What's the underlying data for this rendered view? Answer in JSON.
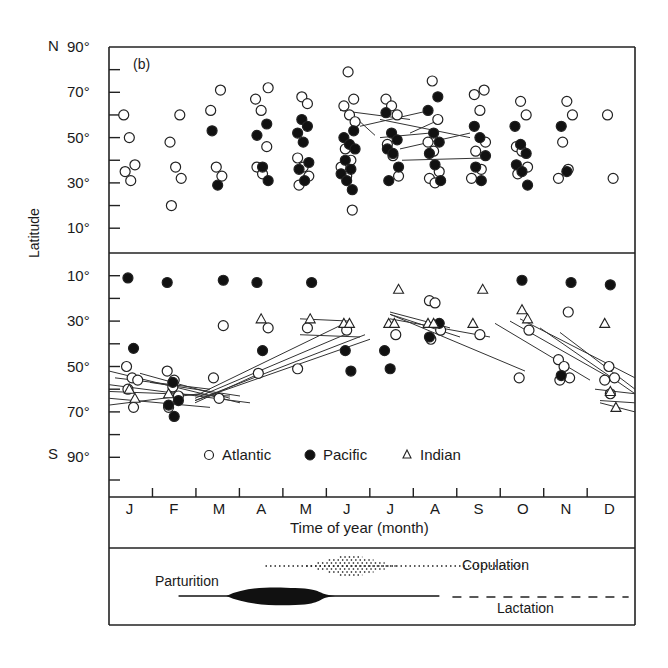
{
  "chart_data": {
    "type": "scatter",
    "panel_label": "(b)",
    "title": "",
    "xlabel": "Time of year (month)",
    "ylabel": "Latitude",
    "categories": [
      "J",
      "F",
      "M",
      "A",
      "M",
      "J",
      "J",
      "A",
      "S",
      "O",
      "N",
      "D"
    ],
    "y_ticks_north": [
      "90°",
      "70°",
      "50°",
      "30°",
      "10°"
    ],
    "y_ticks_south": [
      "10°",
      "30°",
      "50°",
      "70°",
      "90°"
    ],
    "hemisphere_labels": {
      "north": "N",
      "south": "S"
    },
    "legend": [
      {
        "name": "Atlantic",
        "marker": "open-circle"
      },
      {
        "name": "Pacific",
        "marker": "filled-circle"
      },
      {
        "name": "Indian",
        "marker": "open-triangle"
      }
    ],
    "legend_position": "bottom-inside-south-panel",
    "grid": false,
    "series": [
      {
        "name": "Atlantic",
        "hemisphere": "N",
        "points": [
          [
            1,
            60
          ],
          [
            1,
            50
          ],
          [
            1,
            38
          ],
          [
            1,
            35
          ],
          [
            1,
            31
          ],
          [
            2,
            60
          ],
          [
            2,
            48
          ],
          [
            2,
            37
          ],
          [
            2,
            32
          ],
          [
            2,
            20
          ],
          [
            3,
            71
          ],
          [
            3,
            62
          ],
          [
            3,
            37
          ],
          [
            3,
            33
          ],
          [
            4,
            67
          ],
          [
            4,
            62
          ],
          [
            4,
            46
          ],
          [
            4,
            37
          ],
          [
            4,
            34
          ],
          [
            4,
            72
          ],
          [
            5,
            68
          ],
          [
            5,
            65
          ],
          [
            5,
            41
          ],
          [
            5,
            37
          ],
          [
            5,
            33
          ],
          [
            5,
            29
          ],
          [
            6,
            79
          ],
          [
            6,
            67
          ],
          [
            6,
            64
          ],
          [
            6,
            60
          ],
          [
            6,
            57
          ],
          [
            6,
            45
          ],
          [
            6,
            40
          ],
          [
            6,
            37
          ],
          [
            6,
            33
          ],
          [
            6,
            18
          ],
          [
            7,
            67
          ],
          [
            7,
            64
          ],
          [
            7,
            60
          ],
          [
            7,
            47
          ],
          [
            7,
            42
          ],
          [
            7,
            33
          ],
          [
            8,
            75
          ],
          [
            8,
            58
          ],
          [
            8,
            48
          ],
          [
            8,
            44
          ],
          [
            8,
            35
          ],
          [
            8,
            32
          ],
          [
            8,
            30
          ],
          [
            9,
            71
          ],
          [
            9,
            69
          ],
          [
            9,
            62
          ],
          [
            9,
            48
          ],
          [
            9,
            44
          ],
          [
            9,
            36
          ],
          [
            9,
            32
          ],
          [
            10,
            66
          ],
          [
            10,
            60
          ],
          [
            10,
            46
          ],
          [
            10,
            44
          ],
          [
            10,
            37
          ],
          [
            10,
            34
          ],
          [
            11,
            66
          ],
          [
            11,
            60
          ],
          [
            11,
            48
          ],
          [
            11,
            36
          ],
          [
            11,
            32
          ],
          [
            12,
            60
          ],
          [
            12,
            32
          ]
        ]
      },
      {
        "name": "Pacific",
        "hemisphere": "N",
        "points": [
          [
            3,
            53
          ],
          [
            3,
            29
          ],
          [
            4,
            56
          ],
          [
            4,
            51
          ],
          [
            4,
            37
          ],
          [
            4,
            31
          ],
          [
            5,
            58
          ],
          [
            5,
            55
          ],
          [
            5,
            52
          ],
          [
            5,
            48
          ],
          [
            5,
            39
          ],
          [
            5,
            36
          ],
          [
            5,
            31
          ],
          [
            6,
            53
          ],
          [
            6,
            50
          ],
          [
            6,
            47
          ],
          [
            6,
            45
          ],
          [
            6,
            40
          ],
          [
            6,
            36
          ],
          [
            6,
            34
          ],
          [
            6,
            31
          ],
          [
            6,
            27
          ],
          [
            7,
            61
          ],
          [
            7,
            52
          ],
          [
            7,
            49
          ],
          [
            7,
            45
          ],
          [
            7,
            43
          ],
          [
            7,
            37
          ],
          [
            7,
            31
          ],
          [
            8,
            68
          ],
          [
            8,
            62
          ],
          [
            8,
            52
          ],
          [
            8,
            48
          ],
          [
            8,
            43
          ],
          [
            8,
            38
          ],
          [
            8,
            31
          ],
          [
            9,
            55
          ],
          [
            9,
            50
          ],
          [
            9,
            42
          ],
          [
            9,
            37
          ],
          [
            9,
            31
          ],
          [
            10,
            55
          ],
          [
            10,
            47
          ],
          [
            10,
            43
          ],
          [
            10,
            38
          ],
          [
            10,
            35
          ],
          [
            10,
            29
          ],
          [
            11,
            55
          ],
          [
            11,
            35
          ]
        ]
      },
      {
        "name": "Atlantic",
        "hemisphere": "S",
        "points": [
          [
            1,
            50
          ],
          [
            1,
            55
          ],
          [
            1,
            56
          ],
          [
            1,
            60
          ],
          [
            1,
            68
          ],
          [
            2,
            52
          ],
          [
            2,
            59
          ],
          [
            2,
            63
          ],
          [
            2,
            68
          ],
          [
            2,
            56
          ],
          [
            3,
            32
          ],
          [
            3,
            55
          ],
          [
            3,
            64
          ],
          [
            4,
            33
          ],
          [
            4,
            53
          ],
          [
            5,
            33
          ],
          [
            5,
            51
          ],
          [
            6,
            34
          ],
          [
            7,
            36
          ],
          [
            8,
            21
          ],
          [
            8,
            22
          ],
          [
            8,
            34
          ],
          [
            8,
            38
          ],
          [
            9,
            36
          ],
          [
            10,
            34
          ],
          [
            10,
            55
          ],
          [
            11,
            26
          ],
          [
            11,
            47
          ],
          [
            11,
            50
          ],
          [
            11,
            55
          ],
          [
            11,
            56
          ],
          [
            12,
            50
          ],
          [
            12,
            55
          ],
          [
            12,
            56
          ],
          [
            12,
            62
          ]
        ]
      },
      {
        "name": "Pacific",
        "hemisphere": "S",
        "points": [
          [
            1,
            11
          ],
          [
            1,
            42
          ],
          [
            2,
            13
          ],
          [
            2,
            57
          ],
          [
            2,
            65
          ],
          [
            2,
            67
          ],
          [
            2,
            72
          ],
          [
            3,
            12
          ],
          [
            4,
            13
          ],
          [
            4,
            43
          ],
          [
            5,
            13
          ],
          [
            6,
            43
          ],
          [
            6,
            52
          ],
          [
            7,
            43
          ],
          [
            7,
            51
          ],
          [
            8,
            31
          ],
          [
            8,
            37
          ],
          [
            10,
            12
          ],
          [
            11,
            13
          ],
          [
            11,
            54
          ],
          [
            12,
            14
          ]
        ]
      },
      {
        "name": "Indian",
        "hemisphere": "S",
        "points": [
          [
            1,
            60
          ],
          [
            1,
            64
          ],
          [
            2,
            62
          ],
          [
            4,
            29
          ],
          [
            5,
            29
          ],
          [
            6,
            31
          ],
          [
            6,
            31
          ],
          [
            7,
            16
          ],
          [
            7,
            31
          ],
          [
            7,
            31
          ],
          [
            8,
            31
          ],
          [
            8,
            31
          ],
          [
            9,
            16
          ],
          [
            9,
            31
          ],
          [
            10,
            25
          ],
          [
            10,
            29
          ],
          [
            12,
            31
          ],
          [
            12,
            61
          ],
          [
            12,
            68
          ]
        ]
      }
    ],
    "migration_tracks": "straight-line segments linking repeat sightings (mostly Southern Hemisphere Jan–Jun northward and Aug–Dec southward; a few in Northern Hemisphere Jun–Sep)",
    "lifecycle_panel": {
      "copulation": {
        "label": "Copulation",
        "style": "dotted",
        "start_month": 4.6,
        "peak_months": [
          6.0,
          7.6
        ],
        "end_month": 10.6
      },
      "parturition": {
        "label": "Parturition",
        "style": "solid-spindle",
        "start_month": 2.6,
        "peak_months": [
          3.7,
          6.2
        ],
        "end_month": 8.6
      },
      "lactation": {
        "label": "Lactation",
        "style": "dashed",
        "start_month": 8.9,
        "end_month": 13.0
      }
    }
  }
}
